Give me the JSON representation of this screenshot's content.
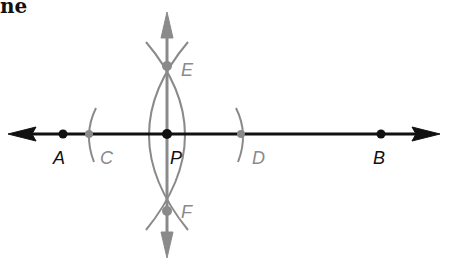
{
  "title_fragment": "ne",
  "colors": {
    "primary_line": "#111111",
    "construction": "#8a8a8a"
  },
  "diagram": {
    "points": [
      {
        "name": "A",
        "label": "A",
        "x": 63,
        "y": 134,
        "style": "primary"
      },
      {
        "name": "C",
        "label": "C",
        "x": 89,
        "y": 134,
        "style": "construction"
      },
      {
        "name": "P",
        "label": "P",
        "x": 167,
        "y": 134,
        "style": "primary"
      },
      {
        "name": "D",
        "label": "D",
        "x": 241,
        "y": 134,
        "style": "construction"
      },
      {
        "name": "B",
        "label": "B",
        "x": 381,
        "y": 134,
        "style": "primary"
      },
      {
        "name": "E",
        "label": "E",
        "x": 167,
        "y": 66,
        "style": "construction"
      },
      {
        "name": "F",
        "label": "F",
        "x": 167,
        "y": 211,
        "style": "construction"
      }
    ],
    "labels": {
      "A": "A",
      "B": "B",
      "C": "C",
      "D": "D",
      "E": "E",
      "F": "F",
      "P": "P"
    }
  }
}
